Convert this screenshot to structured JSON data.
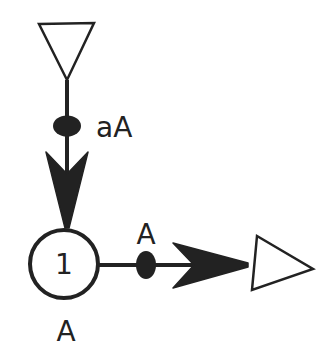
{
  "diagram": {
    "type": "petri-net-like flow diagram",
    "colors": {
      "stroke": "#222222",
      "fill": "#222222",
      "background": "#ffffff"
    },
    "nodes": [
      {
        "id": "source-triangle",
        "shape": "triangle-down",
        "label": ""
      },
      {
        "id": "place-1",
        "shape": "circle",
        "label": "1",
        "sublabel": "A"
      },
      {
        "id": "sink-triangle",
        "shape": "triangle-right",
        "label": ""
      }
    ],
    "edges": [
      {
        "id": "edge-source-to-place",
        "from": "source-triangle",
        "to": "place-1",
        "label": "aA",
        "marker": "ellipse"
      },
      {
        "id": "edge-place-to-sink",
        "from": "place-1",
        "to": "sink-triangle",
        "label": "A",
        "marker": "ellipse"
      }
    ],
    "labels": {
      "incoming_edge": "aA",
      "place_number": "1",
      "place_label": "A",
      "outgoing_edge": "A"
    }
  }
}
